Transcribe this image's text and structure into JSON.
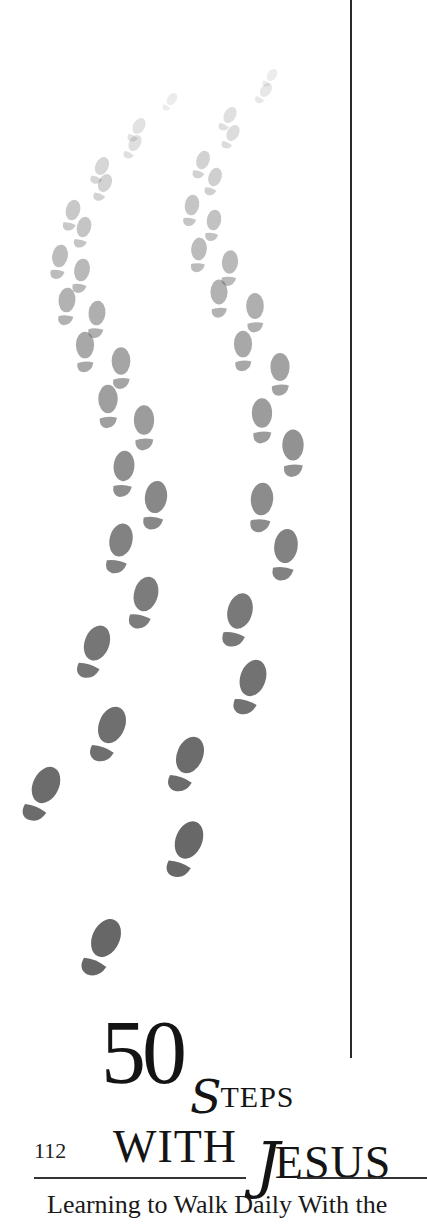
{
  "page": {
    "folio": "112",
    "title": {
      "number": "50",
      "steps_cap": "S",
      "steps_rest": "TEPS",
      "with": "WITH",
      "jesus_cap": "J",
      "jesus_rest": "ESUS"
    },
    "subtitle": "Learning to Walk Daily With the"
  },
  "artwork": {
    "name": "footprints-illustration",
    "description": "Two trails of footprints fading from light gray at top to dark gray at bottom",
    "colors": {
      "faint": "#e6e6e6",
      "mid": "#a8a8a8",
      "dark": "#6e6e6e"
    },
    "footprints": [
      {
        "x": 172,
        "y": 99,
        "s": 0.35,
        "o": 0.12,
        "r": 35
      },
      {
        "x": 139,
        "y": 126,
        "s": 0.45,
        "o": 0.18,
        "r": 30
      },
      {
        "x": 135,
        "y": 143,
        "s": 0.45,
        "o": 0.2,
        "r": 30
      },
      {
        "x": 102,
        "y": 166,
        "s": 0.5,
        "o": 0.26,
        "r": 25
      },
      {
        "x": 105,
        "y": 183,
        "s": 0.5,
        "o": 0.28,
        "r": 25
      },
      {
        "x": 73,
        "y": 210,
        "s": 0.55,
        "o": 0.34,
        "r": 15
      },
      {
        "x": 84,
        "y": 227,
        "s": 0.55,
        "o": 0.36,
        "r": 15
      },
      {
        "x": 60,
        "y": 256,
        "s": 0.6,
        "o": 0.42,
        "r": 10
      },
      {
        "x": 82,
        "y": 270,
        "s": 0.6,
        "o": 0.44,
        "r": 10
      },
      {
        "x": 67,
        "y": 300,
        "s": 0.65,
        "o": 0.48,
        "r": 5
      },
      {
        "x": 97,
        "y": 313,
        "s": 0.65,
        "o": 0.5,
        "r": 5
      },
      {
        "x": 85,
        "y": 345,
        "s": 0.7,
        "o": 0.54,
        "r": 0
      },
      {
        "x": 121,
        "y": 361,
        "s": 0.72,
        "o": 0.56,
        "r": 0
      },
      {
        "x": 108,
        "y": 399,
        "s": 0.75,
        "o": 0.6,
        "r": 0
      },
      {
        "x": 144,
        "y": 420,
        "s": 0.78,
        "o": 0.62,
        "r": 0
      },
      {
        "x": 124,
        "y": 466,
        "s": 0.8,
        "o": 0.7,
        "r": 5
      },
      {
        "x": 156,
        "y": 497,
        "s": 0.85,
        "o": 0.74,
        "r": 8
      },
      {
        "x": 121,
        "y": 540,
        "s": 0.88,
        "o": 0.78,
        "r": 12
      },
      {
        "x": 146,
        "y": 594,
        "s": 0.92,
        "o": 0.82,
        "r": 15
      },
      {
        "x": 97,
        "y": 643,
        "s": 0.95,
        "o": 0.86,
        "r": 20
      },
      {
        "x": 112,
        "y": 725,
        "s": 1.0,
        "o": 0.9,
        "r": 22
      },
      {
        "x": 46,
        "y": 785,
        "s": 1.0,
        "o": 0.92,
        "r": 25
      },
      {
        "x": 106,
        "y": 938,
        "s": 1.05,
        "o": 0.95,
        "r": 25
      },
      {
        "x": 272,
        "y": 75,
        "s": 0.35,
        "o": 0.12,
        "r": 35
      },
      {
        "x": 266,
        "y": 90,
        "s": 0.4,
        "o": 0.15,
        "r": 35
      },
      {
        "x": 230,
        "y": 115,
        "s": 0.45,
        "o": 0.2,
        "r": 30
      },
      {
        "x": 233,
        "y": 133,
        "s": 0.45,
        "o": 0.22,
        "r": 30
      },
      {
        "x": 203,
        "y": 160,
        "s": 0.5,
        "o": 0.28,
        "r": 20
      },
      {
        "x": 215,
        "y": 177,
        "s": 0.5,
        "o": 0.3,
        "r": 20
      },
      {
        "x": 192,
        "y": 205,
        "s": 0.55,
        "o": 0.36,
        "r": 10
      },
      {
        "x": 214,
        "y": 220,
        "s": 0.55,
        "o": 0.38,
        "r": 10
      },
      {
        "x": 199,
        "y": 249,
        "s": 0.6,
        "o": 0.42,
        "r": 5
      },
      {
        "x": 230,
        "y": 262,
        "s": 0.62,
        "o": 0.44,
        "r": 5
      },
      {
        "x": 219,
        "y": 292,
        "s": 0.66,
        "o": 0.48,
        "r": 0
      },
      {
        "x": 255,
        "y": 306,
        "s": 0.68,
        "o": 0.5,
        "r": 0
      },
      {
        "x": 243,
        "y": 344,
        "s": 0.7,
        "o": 0.54,
        "r": 0
      },
      {
        "x": 280,
        "y": 367,
        "s": 0.74,
        "o": 0.58,
        "r": 0
      },
      {
        "x": 262,
        "y": 413,
        "s": 0.78,
        "o": 0.62,
        "r": 0
      },
      {
        "x": 293,
        "y": 445,
        "s": 0.82,
        "o": 0.68,
        "r": 0
      },
      {
        "x": 262,
        "y": 499,
        "s": 0.86,
        "o": 0.72,
        "r": 5
      },
      {
        "x": 286,
        "y": 546,
        "s": 0.9,
        "o": 0.78,
        "r": 8
      },
      {
        "x": 240,
        "y": 611,
        "s": 0.95,
        "o": 0.84,
        "r": 15
      },
      {
        "x": 253,
        "y": 678,
        "s": 0.98,
        "o": 0.88,
        "r": 18
      },
      {
        "x": 190,
        "y": 755,
        "s": 1.0,
        "o": 0.92,
        "r": 22
      },
      {
        "x": 189,
        "y": 840,
        "s": 1.02,
        "o": 0.94,
        "r": 22
      }
    ]
  }
}
